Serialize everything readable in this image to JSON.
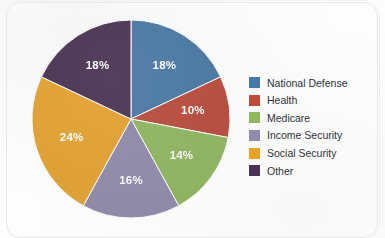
{
  "chart_data": {
    "type": "pie",
    "title": "",
    "subtitle": "",
    "xlabel": "",
    "ylabel": "",
    "legend_position": "right",
    "grid": false,
    "start_angle_deg": 0,
    "direction": "clockwise",
    "units": "percent",
    "total": 100,
    "categories": [
      "National Defense",
      "Health",
      "Medicare",
      "Income Security",
      "Social Security",
      "Other"
    ],
    "values": [
      18,
      10,
      14,
      16,
      24,
      18
    ],
    "data_labels": [
      "18%",
      "10%",
      "14%",
      "16%",
      "24%",
      "18%"
    ],
    "colors": [
      "#4779A8",
      "#BF4B3A",
      "#8FB85C",
      "#908BAD",
      "#E8A329",
      "#4A3355"
    ],
    "slices": [
      {
        "label": "National Defense",
        "value": 18,
        "data_label": "18%",
        "color": "#4779A8"
      },
      {
        "label": "Health",
        "value": 10,
        "data_label": "10%",
        "color": "#BF4B3A"
      },
      {
        "label": "Medicare",
        "value": 14,
        "data_label": "14%",
        "color": "#8FB85C"
      },
      {
        "label": "Income Security",
        "value": 16,
        "data_label": "16%",
        "color": "#908BAD"
      },
      {
        "label": "Social Security",
        "value": 24,
        "data_label": "24%",
        "color": "#E8A329"
      },
      {
        "label": "Other",
        "value": 18,
        "data_label": "18%",
        "color": "#4A3355"
      }
    ]
  },
  "legend": {
    "items": [
      {
        "label": "National Defense",
        "color": "#4779A8"
      },
      {
        "label": "Health",
        "color": "#BF4B3A"
      },
      {
        "label": "Medicare",
        "color": "#8FB85C"
      },
      {
        "label": "Income Security",
        "color": "#908BAD"
      },
      {
        "label": "Social Security",
        "color": "#E8A329"
      },
      {
        "label": "Other",
        "color": "#4A3355"
      }
    ]
  },
  "style": {
    "background": "#fdfdfd",
    "label_text_color": "#ffffff",
    "legend_text_color": "#2f3237"
  }
}
